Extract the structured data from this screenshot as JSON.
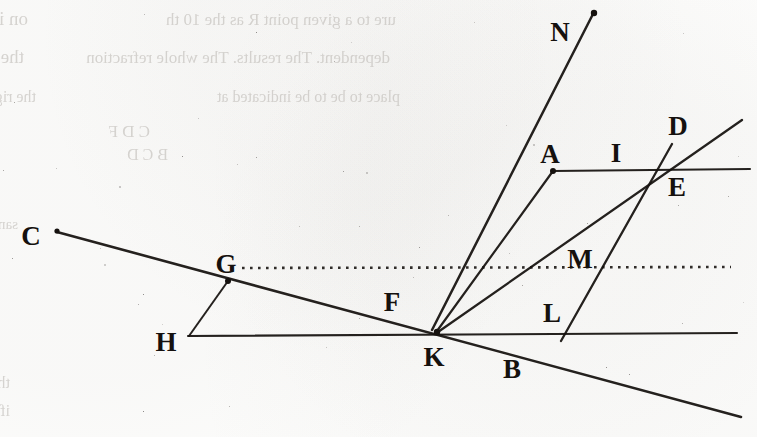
{
  "page": {
    "kind": "scanned-book-page-figure",
    "width": 757,
    "height": 437,
    "background_color": "#fdfdfc",
    "ink_color": "#15110e",
    "bleedthrough_color": "#b9b5b0"
  },
  "figure": {
    "point_labels": [
      {
        "id": "N",
        "text": "N",
        "x": 560,
        "y": 41
      },
      {
        "id": "D",
        "text": "D",
        "x": 678,
        "y": 135
      },
      {
        "id": "A",
        "text": "A",
        "x": 550,
        "y": 163
      },
      {
        "id": "I",
        "text": "I",
        "x": 616,
        "y": 162
      },
      {
        "id": "E",
        "text": "E",
        "x": 677,
        "y": 196
      },
      {
        "id": "C",
        "text": "C",
        "x": 31,
        "y": 245
      },
      {
        "id": "G",
        "text": "G",
        "x": 226,
        "y": 273
      },
      {
        "id": "M",
        "text": "M",
        "x": 580,
        "y": 268
      },
      {
        "id": "F",
        "text": "F",
        "x": 392,
        "y": 311
      },
      {
        "id": "L",
        "text": "L",
        "x": 552,
        "y": 322
      },
      {
        "id": "H",
        "text": "H",
        "x": 166,
        "y": 351
      },
      {
        "id": "K",
        "text": "K",
        "x": 434,
        "y": 366
      },
      {
        "id": "B",
        "text": "B",
        "x": 512,
        "y": 378
      }
    ],
    "lines": [
      {
        "id": "line-C-K-B",
        "from": "C",
        "to": "B-extended",
        "x1": 57,
        "y1": 232,
        "x2": 741,
        "y2": 417,
        "width": 2.6,
        "style": "solid"
      },
      {
        "id": "line-H-right",
        "from": "H",
        "to": "right-edge",
        "x1": 188,
        "y1": 336,
        "x2": 737,
        "y2": 333,
        "width": 2.1,
        "style": "solid"
      },
      {
        "id": "line-A-I-E-right",
        "from": "A",
        "to": "right-edge",
        "x1": 553,
        "y1": 171,
        "x2": 750,
        "y2": 169,
        "width": 2.1,
        "style": "solid"
      },
      {
        "id": "line-G-H",
        "from": "G",
        "to": "H",
        "x1": 228,
        "y1": 281,
        "x2": 189,
        "y2": 336,
        "width": 2.0,
        "style": "solid"
      },
      {
        "id": "line-K-N",
        "from": "K",
        "to": "N",
        "x1": 432,
        "y1": 330,
        "x2": 593,
        "y2": 14,
        "width": 2.5,
        "style": "solid"
      },
      {
        "id": "line-K-A",
        "from": "K",
        "to": "A",
        "x1": 437,
        "y1": 331,
        "x2": 553,
        "y2": 171,
        "width": 2.2,
        "style": "solid"
      },
      {
        "id": "line-K-D",
        "from": "K",
        "to": "D",
        "x1": 438,
        "y1": 332,
        "x2": 742,
        "y2": 120,
        "width": 2.3,
        "style": "solid"
      },
      {
        "id": "line-L-D",
        "from": "L",
        "to": "D",
        "x1": 561,
        "y1": 341,
        "x2": 672,
        "y2": 144,
        "width": 2.3,
        "style": "solid"
      }
    ],
    "dotted_line": {
      "id": "dotted-axis-G-M",
      "label": "dotted horizontal axis through G and M",
      "x1": 242,
      "y1": 268,
      "x2": 731,
      "y2": 267,
      "style": "dotted"
    },
    "dots": [
      {
        "id": "dot-C",
        "x": 57,
        "y": 231,
        "r": 2.6
      },
      {
        "id": "dot-G",
        "x": 228,
        "y": 281,
        "r": 3.0
      },
      {
        "id": "dot-A",
        "x": 553,
        "y": 171,
        "r": 3.0
      },
      {
        "id": "dot-N",
        "x": 594,
        "y": 13,
        "r": 3.2
      },
      {
        "id": "dot-K",
        "x": 437,
        "y": 332,
        "r": 3.2
      }
    ]
  },
  "bleedthrough": {
    "note": "Mirror-reversed ghost text showing through from the reverse side of the leaf; not legible as real reading text.",
    "lines": [
      {
        "id": "bt-1",
        "text": "on in a certain ratio; DVG is a de",
        "x": 28,
        "y": 8,
        "size": 19
      },
      {
        "id": "bt-2",
        "text": "the whole refraction may be indicat",
        "x": 24,
        "y": 46,
        "size": 19
      },
      {
        "id": "bt-3",
        "text": "the right-hand margin",
        "x": 36,
        "y": 88,
        "size": 16
      },
      {
        "id": "bt-4",
        "text": "ure to a given point R as the 10 th",
        "x": 396,
        "y": 10,
        "size": 17
      },
      {
        "id": "bt-5",
        "text": "dependent. The results. The whole refraction",
        "x": 390,
        "y": 48,
        "size": 17
      },
      {
        "id": "bt-6",
        "text": "place to be to be indicated at",
        "x": 400,
        "y": 88,
        "size": 16
      },
      {
        "id": "bt-7",
        "text": "C D F",
        "x": 150,
        "y": 122,
        "size": 17
      },
      {
        "id": "bt-8",
        "text": "B C D",
        "x": 168,
        "y": 146,
        "size": 16
      },
      {
        "id": "bt-9",
        "text": "same in whatever way is taken that the light is twice from C or and the nearer",
        "x": 18,
        "y": 216,
        "size": 15
      },
      {
        "id": "bt-10",
        "text": "the light reflected from CB to the white ground, it to the refle",
        "x": 10,
        "y": 374,
        "size": 16
      },
      {
        "id": "bt-11",
        "text": "if we describe the experiment it would the same place, and so in the",
        "x": 10,
        "y": 402,
        "size": 16
      }
    ]
  }
}
